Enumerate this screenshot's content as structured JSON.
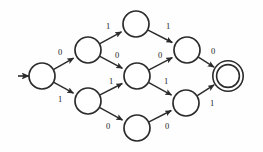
{
  "diagram": {
    "type": "finite-state-automaton",
    "title": "",
    "alphabet": [
      "0",
      "1"
    ],
    "colors": {
      "stroke": "#2b2b2b",
      "fill": "#ffffff",
      "background": "#fefefe",
      "label": "#1d1d1d"
    },
    "states": [
      {
        "id": "q0",
        "label": "",
        "cx": 42,
        "cy": 76,
        "r": 13,
        "start": true,
        "accept": false
      },
      {
        "id": "q1",
        "label": "",
        "cx": 88,
        "cy": 50,
        "r": 13,
        "start": false,
        "accept": false
      },
      {
        "id": "q2",
        "label": "",
        "cx": 88,
        "cy": 101,
        "r": 13,
        "start": false,
        "accept": false
      },
      {
        "id": "q3",
        "label": "",
        "cx": 136,
        "cy": 24,
        "r": 13,
        "start": false,
        "accept": false
      },
      {
        "id": "q4",
        "label": "",
        "cx": 137,
        "cy": 76,
        "r": 13,
        "start": false,
        "accept": false
      },
      {
        "id": "q5",
        "label": "",
        "cx": 137,
        "cy": 128,
        "r": 13,
        "start": false,
        "accept": false
      },
      {
        "id": "q6",
        "label": "",
        "cx": 187,
        "cy": 50,
        "r": 13,
        "start": false,
        "accept": false
      },
      {
        "id": "q7",
        "label": "",
        "cx": 186,
        "cy": 103,
        "r": 13,
        "start": false,
        "accept": false
      },
      {
        "id": "q8",
        "label": "",
        "cx": 228,
        "cy": 76,
        "r": 12,
        "start": false,
        "accept": true
      }
    ],
    "start_arrow": {
      "x1": 18,
      "y1": 76,
      "x2": 29,
      "y2": 76
    },
    "transitions": [
      {
        "from": "q0",
        "to": "q1",
        "symbol": "0",
        "lx": 60,
        "ly": 53
      },
      {
        "from": "q0",
        "to": "q2",
        "symbol": "1",
        "lx": 60,
        "ly": 100
      },
      {
        "from": "q1",
        "to": "q3",
        "symbol": "1",
        "lx": 108,
        "ly": 27
      },
      {
        "from": "q1",
        "to": "q4",
        "symbol": "0",
        "lx": 117,
        "ly": 56
      },
      {
        "from": "q2",
        "to": "q4",
        "symbol": "1",
        "lx": 111,
        "ly": 82
      },
      {
        "from": "q2",
        "to": "q5",
        "symbol": "0",
        "lx": 108,
        "ly": 127
      },
      {
        "from": "q3",
        "to": "q6",
        "symbol": "1",
        "lx": 168,
        "ly": 27
      },
      {
        "from": "q4",
        "to": "q6",
        "symbol": "0",
        "lx": 160,
        "ly": 56
      },
      {
        "from": "q4",
        "to": "q7",
        "symbol": "1",
        "lx": 166,
        "ly": 82
      },
      {
        "from": "q5",
        "to": "q7",
        "symbol": "0",
        "lx": 167,
        "ly": 127
      },
      {
        "from": "q6",
        "to": "q8",
        "symbol": "0",
        "lx": 213,
        "ly": 52
      },
      {
        "from": "q7",
        "to": "q8",
        "symbol": "1",
        "lx": 212,
        "ly": 104
      }
    ]
  }
}
